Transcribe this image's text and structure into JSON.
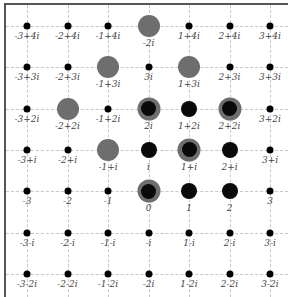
{
  "diagram": {
    "title": "",
    "type": "complex-integer-lattice",
    "x_range": [
      -3,
      3
    ],
    "y_range": [
      -2,
      4
    ],
    "colors": {
      "gray_marker": "#6e6e6e",
      "black_marker": "#0a0a0a",
      "grid": "#c8c8c8",
      "label": "#444444",
      "border": "#555555"
    },
    "points": [
      {
        "re": -3,
        "im": 4,
        "label": "-3+4i",
        "marker": "small"
      },
      {
        "re": -2,
        "im": 4,
        "label": "-2+4i",
        "marker": "small"
      },
      {
        "re": -1,
        "im": 4,
        "label": "-1+4i",
        "marker": "small"
      },
      {
        "re": 0,
        "im": 4,
        "label": "-2i",
        "marker": "gray"
      },
      {
        "re": 1,
        "im": 4,
        "label": "1+4i",
        "marker": "small"
      },
      {
        "re": 2,
        "im": 4,
        "label": "2+4i",
        "marker": "small"
      },
      {
        "re": 3,
        "im": 4,
        "label": "3+4i",
        "marker": "small"
      },
      {
        "re": -3,
        "im": 3,
        "label": "-3+3i",
        "marker": "small"
      },
      {
        "re": -2,
        "im": 3,
        "label": "-2+3i",
        "marker": "small"
      },
      {
        "re": -1,
        "im": 3,
        "label": "-1+3i",
        "marker": "gray"
      },
      {
        "re": 0,
        "im": 3,
        "label": "3i",
        "marker": "small"
      },
      {
        "re": 1,
        "im": 3,
        "label": "1+3i",
        "marker": "gray"
      },
      {
        "re": 2,
        "im": 3,
        "label": "2+3i",
        "marker": "small"
      },
      {
        "re": 3,
        "im": 3,
        "label": "3+3i",
        "marker": "small"
      },
      {
        "re": -3,
        "im": 2,
        "label": "-3+2i",
        "marker": "small"
      },
      {
        "re": -2,
        "im": 2,
        "label": "-2+2i",
        "marker": "gray"
      },
      {
        "re": -1,
        "im": 2,
        "label": "-1+2i",
        "marker": "small"
      },
      {
        "re": 0,
        "im": 2,
        "label": "2i",
        "marker": "both"
      },
      {
        "re": 1,
        "im": 2,
        "label": "1+2i",
        "marker": "medium"
      },
      {
        "re": 2,
        "im": 2,
        "label": "2+2i",
        "marker": "both"
      },
      {
        "re": 3,
        "im": 2,
        "label": "3+2i",
        "marker": "small"
      },
      {
        "re": -3,
        "im": 1,
        "label": "-3+i",
        "marker": "small"
      },
      {
        "re": -2,
        "im": 1,
        "label": "-2+i",
        "marker": "small"
      },
      {
        "re": -1,
        "im": 1,
        "label": "-1+i",
        "marker": "gray"
      },
      {
        "re": 0,
        "im": 1,
        "label": "i",
        "marker": "medium"
      },
      {
        "re": 1,
        "im": 1,
        "label": "1+i",
        "marker": "both"
      },
      {
        "re": 2,
        "im": 1,
        "label": "2+i",
        "marker": "medium"
      },
      {
        "re": 3,
        "im": 1,
        "label": "3+i",
        "marker": "small"
      },
      {
        "re": -3,
        "im": 0,
        "label": "-3",
        "marker": "small"
      },
      {
        "re": -2,
        "im": 0,
        "label": "-2",
        "marker": "small"
      },
      {
        "re": -1,
        "im": 0,
        "label": "-1",
        "marker": "small"
      },
      {
        "re": 0,
        "im": 0,
        "label": "0",
        "marker": "both"
      },
      {
        "re": 1,
        "im": 0,
        "label": "1",
        "marker": "medium"
      },
      {
        "re": 2,
        "im": 0,
        "label": "2",
        "marker": "medium"
      },
      {
        "re": 3,
        "im": 0,
        "label": "3",
        "marker": "small"
      },
      {
        "re": -3,
        "im": -1,
        "label": "-3-i",
        "marker": "small"
      },
      {
        "re": -2,
        "im": -1,
        "label": "-2-i",
        "marker": "small"
      },
      {
        "re": -1,
        "im": -1,
        "label": "-1-i",
        "marker": "small"
      },
      {
        "re": 0,
        "im": -1,
        "label": "-i",
        "marker": "small"
      },
      {
        "re": 1,
        "im": -1,
        "label": "1-i",
        "marker": "small"
      },
      {
        "re": 2,
        "im": -1,
        "label": "2-i",
        "marker": "small"
      },
      {
        "re": 3,
        "im": -1,
        "label": "3-i",
        "marker": "small"
      },
      {
        "re": -3,
        "im": -2,
        "label": "-3-2i",
        "marker": "small"
      },
      {
        "re": -2,
        "im": -2,
        "label": "-2-2i",
        "marker": "small"
      },
      {
        "re": -1,
        "im": -2,
        "label": "-1-2i",
        "marker": "small"
      },
      {
        "re": 0,
        "im": -2,
        "label": "-2i",
        "marker": "small"
      },
      {
        "re": 1,
        "im": -2,
        "label": "1-2i",
        "marker": "small"
      },
      {
        "re": 2,
        "im": -2,
        "label": "2-2i",
        "marker": "small"
      },
      {
        "re": 3,
        "im": -2,
        "label": "3-2i",
        "marker": "small"
      }
    ]
  }
}
